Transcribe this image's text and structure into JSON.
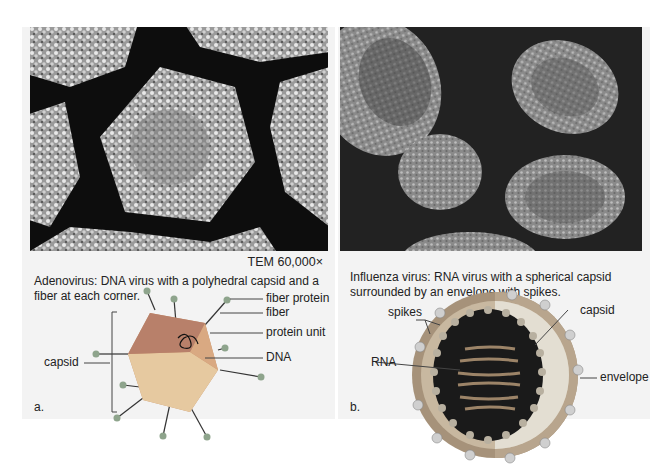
{
  "panel_a": {
    "letter": "a.",
    "magnification": "TEM 60,000×",
    "caption": "Adenovirus: DNA virus with a polyhedral capsid and a fiber at each corner.",
    "labels": {
      "fiber_protein": "fiber protein",
      "fiber": "fiber",
      "protein_unit": "protein unit",
      "dna": "DNA",
      "capsid": "capsid"
    }
  },
  "panel_b": {
    "letter": "b.",
    "caption": "Influenza virus: RNA virus with a spherical capsid surrounded by an envelope with spikes.",
    "labels": {
      "spikes": "spikes",
      "capsid": "capsid",
      "rna": "RNA",
      "envelope": "envelope"
    }
  },
  "colors": {
    "panel_bg": "#f3f3f3",
    "capsid_light": "#e9cfa0",
    "capsid_mid": "#c9956a",
    "capsid_dark": "#b0725a",
    "fiber_knob": "#8aa08a",
    "envelope": "#b8a58d",
    "capsid_b": "#d9d4c6",
    "rna": "#a89070"
  }
}
